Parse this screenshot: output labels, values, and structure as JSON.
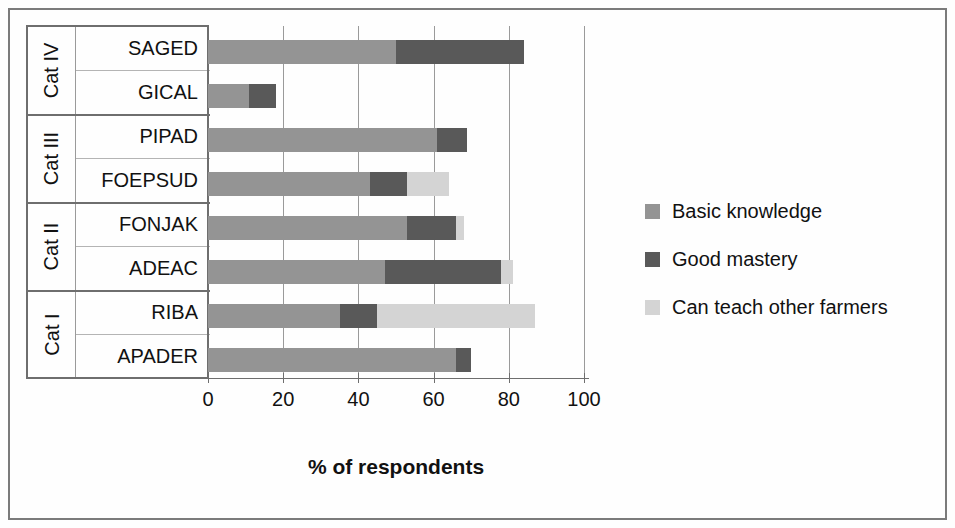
{
  "chart_data": {
    "type": "bar",
    "orientation": "horizontal",
    "stacked": true,
    "title": "",
    "xlabel": "% of respondents",
    "ylabel": "",
    "xlim": [
      0,
      100
    ],
    "xticks": [
      0,
      20,
      40,
      60,
      80,
      100
    ],
    "xtick_labels": [
      "0",
      "20",
      "40",
      "60",
      "80",
      "100"
    ],
    "grid": "vertical",
    "legend_position": "right",
    "categories": [
      "APADER",
      "RIBA",
      "ADEAC",
      "FONJAK",
      "FOEPSUD",
      "PIPAD",
      "GICAL",
      "SAGED"
    ],
    "groups": [
      {
        "label": "Cat I",
        "members": [
          "APADER",
          "RIBA"
        ]
      },
      {
        "label": "Cat II",
        "members": [
          "ADEAC",
          "FONJAK"
        ]
      },
      {
        "label": "Cat III",
        "members": [
          "FOEPSUD",
          "PIPAD"
        ]
      },
      {
        "label": "Cat IV",
        "members": [
          "GICAL",
          "SAGED"
        ]
      }
    ],
    "series": [
      {
        "name": "Basic knowledge",
        "color": "#949494",
        "values": [
          66,
          35,
          47,
          53,
          43,
          61,
          11,
          50
        ]
      },
      {
        "name": "Good mastery",
        "color": "#595959",
        "values": [
          4,
          10,
          31,
          13,
          10,
          8,
          7,
          34
        ]
      },
      {
        "name": "Can teach other farmers",
        "color": "#d4d4d4",
        "values": [
          0,
          42,
          3,
          2,
          11,
          0,
          0,
          0
        ]
      }
    ],
    "totals": [
      70,
      87,
      81,
      68,
      64,
      69,
      18,
      84
    ]
  },
  "axis": {
    "x_title": "% of respondents",
    "ticks": [
      "0",
      "20",
      "40",
      "60",
      "80",
      "100"
    ]
  },
  "legend": {
    "items": [
      {
        "label": "Basic knowledge",
        "color": "#949494"
      },
      {
        "label": "Good mastery",
        "color": "#595959"
      },
      {
        "label": "Can teach other farmers",
        "color": "#d4d4d4"
      }
    ]
  },
  "rows": [
    {
      "name": "SAGED",
      "group": "Cat IV",
      "basic": 50,
      "good": 34,
      "teach": 0
    },
    {
      "name": "GICAL",
      "group": "Cat IV",
      "basic": 11,
      "good": 7,
      "teach": 0
    },
    {
      "name": "PIPAD",
      "group": "Cat III",
      "basic": 61,
      "good": 8,
      "teach": 0
    },
    {
      "name": "FOEPSUD",
      "group": "Cat III",
      "basic": 43,
      "good": 10,
      "teach": 11
    },
    {
      "name": "FONJAK",
      "group": "Cat II",
      "basic": 53,
      "good": 13,
      "teach": 2
    },
    {
      "name": "ADEAC",
      "group": "Cat II",
      "basic": 47,
      "good": 31,
      "teach": 3
    },
    {
      "name": "RIBA",
      "group": "Cat I",
      "basic": 35,
      "good": 10,
      "teach": 42
    },
    {
      "name": "APADER",
      "group": "Cat I",
      "basic": 66,
      "good": 4,
      "teach": 0
    }
  ],
  "groups": [
    {
      "label": "Cat IV"
    },
    {
      "label": "Cat III"
    },
    {
      "label": "Cat II"
    },
    {
      "label": "Cat I"
    }
  ],
  "colors": {
    "basic": "#949494",
    "good": "#595959",
    "teach": "#d4d4d4",
    "frame": "#7b7b7b",
    "grid": "#9a9a9a"
  }
}
